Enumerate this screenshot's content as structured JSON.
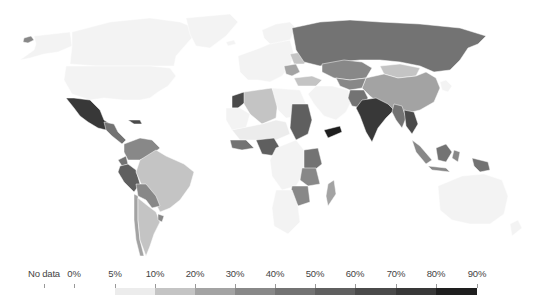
{
  "map": {
    "type": "choropleth",
    "projection": "robinson-like",
    "no_data_color": "#f2f2f2",
    "border_color": "#ffffff"
  },
  "legend": {
    "no_data_label": "No data",
    "labels": [
      "0%",
      "5%",
      "10%",
      "20%",
      "30%",
      "40%",
      "50%",
      "60%",
      "70%",
      "80%",
      "90%"
    ],
    "bins": [
      {
        "from": "0%",
        "to": "5%",
        "color": "#f3f3f3"
      },
      {
        "from": "5%",
        "to": "10%",
        "color": "#ececec"
      },
      {
        "from": "10%",
        "to": "20%",
        "color": "#c4c4c4"
      },
      {
        "from": "20%",
        "to": "30%",
        "color": "#a3a3a3"
      },
      {
        "from": "30%",
        "to": "40%",
        "color": "#888888"
      },
      {
        "from": "40%",
        "to": "50%",
        "color": "#737373"
      },
      {
        "from": "50%",
        "to": "60%",
        "color": "#5f5f5f"
      },
      {
        "from": "60%",
        "to": "70%",
        "color": "#4a4a4a"
      },
      {
        "from": "70%",
        "to": "80%",
        "color": "#383838"
      },
      {
        "from": "80%",
        "to": "90%",
        "color": "#1e1e1e"
      }
    ]
  },
  "regions": [
    {
      "name": "Alaska-Russia east tip",
      "bin": 4,
      "d": "M24 38 L31 36 L34 40 L28 43 L23 42 Z"
    },
    {
      "name": "Alaska",
      "bin": 0,
      "d": "M34 36 L70 32 L72 46 L58 52 L44 54 L30 58 L20 60 L34 50 L36 44 Z"
    },
    {
      "name": "Canada",
      "bin": 0,
      "d": "M72 32 L110 22 L150 18 L180 22 L200 30 L190 40 L176 56 L174 66 L150 66 L120 66 L96 66 L70 64 L72 46 Z"
    },
    {
      "name": "Greenland",
      "bin": 0,
      "d": "M186 18 L230 14 L238 22 L226 36 L210 48 L196 46 L190 34 Z"
    },
    {
      "name": "Iceland",
      "bin": 0,
      "d": "M226 42 L234 40 L236 44 L228 46 Z"
    },
    {
      "name": "USA",
      "bin": 0,
      "d": "M66 66 L96 66 L120 66 L150 66 L170 68 L176 76 L168 86 L158 92 L150 98 L140 100 L124 100 L104 98 L90 100 L72 94 L64 80 Z"
    },
    {
      "name": "Mexico",
      "bin": 8,
      "d": "M66 98 L74 98 L90 100 L100 110 L104 120 L110 124 L106 130 L98 128 L88 122 L80 116 L74 108 Z"
    },
    {
      "name": "Central America",
      "bin": 5,
      "d": "M104 122 L114 124 L118 132 L126 140 L122 144 L112 136 L106 130 Z"
    },
    {
      "name": "Cuba-Haiti",
      "bin": 7,
      "d": "M128 120 L140 120 L142 124 L134 124 Z"
    },
    {
      "name": "Colombia-Venezuela",
      "bin": 4,
      "d": "M124 144 L140 138 L152 140 L160 148 L150 156 L140 160 L128 160 L124 152 Z"
    },
    {
      "name": "Ecuador",
      "bin": 5,
      "d": "M118 160 L126 156 L128 164 L122 166 Z"
    },
    {
      "name": "Peru",
      "bin": 6,
      "d": "M120 166 L128 164 L136 170 L140 184 L134 192 L124 182 L118 172 Z"
    },
    {
      "name": "Brazil",
      "bin": 2,
      "d": "M140 160 L156 150 L166 156 L184 164 L194 172 L190 186 L180 200 L170 208 L160 212 L156 204 L150 192 L142 186 L136 172 Z"
    },
    {
      "name": "Bolivia-Paraguay",
      "bin": 4,
      "d": "M136 184 L146 184 L156 196 L160 206 L152 208 L146 200 L138 196 Z"
    },
    {
      "name": "Chile",
      "bin": 3,
      "d": "M134 194 L138 196 L138 220 L140 240 L144 256 L140 256 L136 240 L134 220 Z"
    },
    {
      "name": "Argentina",
      "bin": 2,
      "d": "M138 198 L148 206 L156 212 L160 222 L154 234 L150 246 L146 256 L140 240 L138 220 Z"
    },
    {
      "name": "Uruguay",
      "bin": 4,
      "d": "M158 214 L164 216 L162 222 L158 220 Z"
    },
    {
      "name": "Europe west",
      "bin": 0,
      "d": "M238 56 L260 48 L274 42 L290 40 L294 54 L290 66 L282 76 L270 82 L258 80 L248 80 L240 72 Z"
    },
    {
      "name": "Scandinavia",
      "bin": 0,
      "d": "M262 30 L276 24 L290 22 L296 28 L290 40 L280 42 L270 44 L264 38 Z"
    },
    {
      "name": "Ukraine-Belarus",
      "bin": 2,
      "d": "M290 54 L302 52 L308 58 L304 64 L294 64 Z"
    },
    {
      "name": "Balkans-Eastern Europe",
      "bin": 3,
      "d": "M284 66 L296 64 L300 72 L292 76 L286 74 Z"
    },
    {
      "name": "Turkey",
      "bin": 2,
      "d": "M294 78 L312 76 L322 80 L316 86 L298 86 Z"
    },
    {
      "name": "Russia",
      "bin": 5,
      "d": "M292 28 L320 22 L350 20 L380 22 L420 24 L460 28 L486 36 L478 44 L468 48 L460 60 L450 70 L434 72 L420 66 L400 62 L380 60 L360 60 L340 62 L320 66 L304 62 L296 50 Z"
    },
    {
      "name": "Kazakhstan",
      "bin": 4,
      "d": "M322 64 L344 60 L362 62 L372 68 L366 78 L350 80 L334 78 L322 72 Z"
    },
    {
      "name": "Mongolia",
      "bin": 2,
      "d": "M380 66 L400 64 L420 68 L416 76 L398 78 L384 74 Z"
    },
    {
      "name": "China",
      "bin": 3,
      "d": "M366 78 L384 74 L398 78 L416 76 L426 72 L436 78 L440 88 L434 102 L420 110 L404 114 L392 110 L380 104 L370 96 L362 88 Z"
    },
    {
      "name": "Central Asia",
      "bin": 4,
      "d": "M336 78 L350 80 L366 78 L362 88 L350 90 L340 86 Z"
    },
    {
      "name": "Middle East",
      "bin": 0,
      "d": "M316 86 L332 86 L348 90 L352 100 L346 112 L336 120 L324 116 L314 104 L308 94 Z"
    },
    {
      "name": "Pakistan-Afghanistan",
      "bin": 5,
      "d": "M350 90 L364 90 L368 98 L362 108 L352 106 L348 98 Z"
    },
    {
      "name": "India",
      "bin": 8,
      "d": "M362 100 L376 98 L388 104 L394 110 L386 118 L378 128 L372 142 L366 132 L360 116 L356 108 Z"
    },
    {
      "name": "Myanmar-Thailand",
      "bin": 5,
      "d": "M394 104 L402 106 L406 118 L402 128 L396 120 L392 112 Z"
    },
    {
      "name": "Vietnam-Laos-Cambodia",
      "bin": 7,
      "d": "M404 110 L414 112 L418 124 L412 134 L406 126 Z"
    },
    {
      "name": "Korea-Japan",
      "bin": 0,
      "d": "M440 82 L446 80 L452 86 L448 92 L442 90 Z"
    },
    {
      "name": "Malaysia-Sumatra",
      "bin": 4,
      "d": "M412 140 L420 146 L432 160 L426 164 L416 152 Z"
    },
    {
      "name": "Borneo",
      "bin": 5,
      "d": "M436 148 L446 144 L452 152 L446 162 L438 160 Z"
    },
    {
      "name": "Java",
      "bin": 4,
      "d": "M428 166 L446 168 L450 172 L432 170 Z"
    },
    {
      "name": "Papua",
      "bin": 5,
      "d": "M472 158 L488 162 L490 170 L480 172 L474 166 Z"
    },
    {
      "name": "Sulawesi-Philippines",
      "bin": 4,
      "d": "M454 150 L460 152 L458 162 L452 158 Z"
    },
    {
      "name": "Australia",
      "bin": 0,
      "d": "M438 186 L462 176 L484 174 L502 180 L508 196 L504 214 L490 224 L470 224 L452 220 L440 210 Z"
    },
    {
      "name": "New Zealand",
      "bin": 0,
      "d": "M510 224 L518 220 L522 228 L512 236 Z"
    },
    {
      "name": "Morocco",
      "bin": 7,
      "d": "M232 96 L244 92 L248 100 L238 108 L232 108 Z"
    },
    {
      "name": "Algeria-North Africa",
      "bin": 2,
      "d": "M244 92 L272 88 L278 100 L276 118 L262 124 L250 114 L244 104 Z"
    },
    {
      "name": "Libya-Egypt",
      "bin": 0,
      "d": "M272 88 L300 90 L306 104 L300 116 L286 118 L278 110 Z"
    },
    {
      "name": "Western Sahara-Mauritania",
      "bin": 0,
      "d": "M226 108 L240 108 L250 114 L246 128 L232 130 L226 120 Z"
    },
    {
      "name": "Sudan-Ethiopia",
      "bin": 6,
      "d": "M292 104 L308 104 L312 120 L308 134 L296 140 L290 128 Z"
    },
    {
      "name": "Yemen",
      "bin": 9,
      "d": "M324 130 L340 126 L342 132 L328 138 Z"
    },
    {
      "name": "West Africa Sahel",
      "bin": 1,
      "d": "M232 130 L262 124 L276 120 L286 122 L290 134 L276 140 L258 140 L240 140 Z"
    },
    {
      "name": "West Africa coast",
      "bin": 5,
      "d": "M230 140 L246 140 L254 148 L242 150 L232 148 Z"
    },
    {
      "name": "Nigeria",
      "bin": 6,
      "d": "M256 140 L274 138 L280 148 L276 156 L262 154 Z"
    },
    {
      "name": "Central Africa",
      "bin": 0,
      "d": "M276 148 L296 140 L304 150 L306 170 L296 186 L282 190 L272 176 L270 160 Z"
    },
    {
      "name": "East Africa",
      "bin": 5,
      "d": "M304 150 L318 148 L322 164 L312 172 L304 168 Z"
    },
    {
      "name": "Tanzania",
      "bin": 4,
      "d": "M302 168 L316 168 L320 184 L308 186 L300 180 Z"
    },
    {
      "name": "Zambia-Zimbabwe",
      "bin": 4,
      "d": "M292 186 L308 186 L310 202 L298 206 L290 196 Z"
    },
    {
      "name": "Southern Africa",
      "bin": 0,
      "d": "M276 190 L292 190 L298 206 L300 222 L288 234 L274 226 L272 208 Z"
    },
    {
      "name": "Madagascar",
      "bin": 3,
      "d": "M328 184 L334 180 L336 194 L328 206 L326 196 Z"
    }
  ]
}
